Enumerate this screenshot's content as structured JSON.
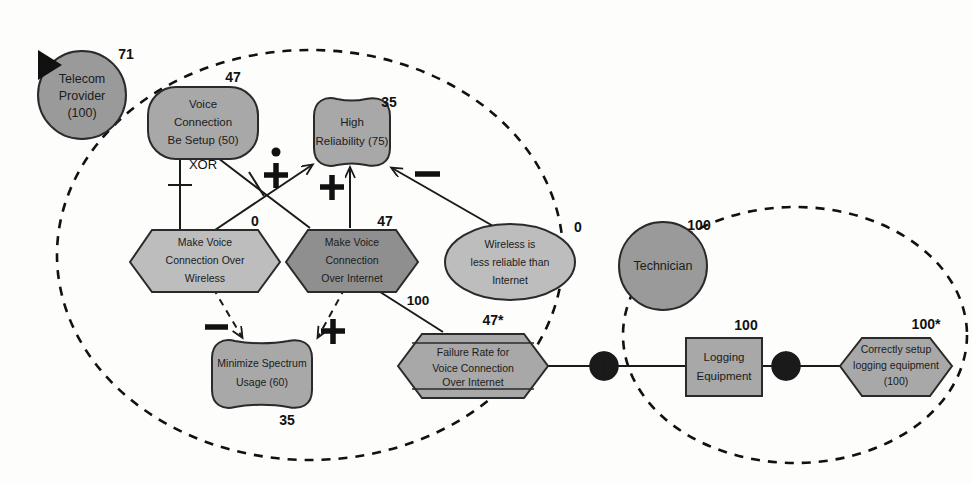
{
  "diagram": {
    "notation": "GRL (Goal-oriented Requirement Language)",
    "colors": {
      "fill_actor": "#9a9a9a",
      "fill_dark": "#8f8f8f",
      "fill_light": "#bdbdbd",
      "fill_mid": "#a8a8a8",
      "stroke": "#2a2a2a",
      "text": "#1b1b1b",
      "boundary": "#111111"
    }
  },
  "actors": [
    {
      "id": "telecom-provider",
      "name": "Telecom\nProvider\n(100)",
      "line1": "Telecom",
      "line2": "Provider",
      "line3": "(100)",
      "evaluation": "71",
      "selected": true
    },
    {
      "id": "technician",
      "name": "Technician",
      "line1": "Technician",
      "evaluation": "100",
      "selected": false
    }
  ],
  "elements": [
    {
      "id": "voice-connection-be-setup",
      "type": "goal",
      "lines": [
        "Voice",
        "Connection",
        "Be Setup (50)"
      ],
      "evaluation": "47"
    },
    {
      "id": "high-reliability",
      "type": "softgoal",
      "lines": [
        "High",
        "Reliability (75)"
      ],
      "evaluation": "35"
    },
    {
      "id": "make-voice-connection-over-wireless",
      "type": "task",
      "lines": [
        "Make Voice",
        "Connection Over",
        "Wireless"
      ],
      "evaluation": "0"
    },
    {
      "id": "make-voice-connection-over-internet",
      "type": "task",
      "lines": [
        "Make Voice",
        "Connection",
        "Over Internet"
      ],
      "evaluation": "47"
    },
    {
      "id": "wireless-is-less-reliable-than-internet",
      "type": "belief",
      "lines": [
        "Wireless is",
        "less reliable than",
        "Internet"
      ],
      "evaluation": "0"
    },
    {
      "id": "minimize-spectrum-usage",
      "type": "softgoal",
      "lines": [
        "Minimize Spectrum",
        "Usage (60)"
      ],
      "evaluation": "35"
    },
    {
      "id": "failure-rate-for-voice-connection-over-internet",
      "type": "indicator",
      "lines": [
        "Failure Rate for",
        "Voice Connection",
        "Over Internet"
      ],
      "evaluation": "47*"
    },
    {
      "id": "logging-equipment",
      "type": "resource",
      "lines": [
        "Logging",
        "Equipment"
      ],
      "evaluation": "100"
    },
    {
      "id": "correctly-setup-logging-equipment",
      "type": "indicator",
      "lines": [
        "Correctly setup",
        "logging equipment",
        "(100)"
      ],
      "evaluation": "100*"
    }
  ],
  "links": [
    {
      "id": "decomp-xor",
      "type": "decomposition",
      "label": "XOR",
      "from": "make-voice-connection-over-wireless",
      "to": "voice-connection-be-setup"
    },
    {
      "id": "decomp-internet",
      "type": "decomposition",
      "label": "",
      "from": "make-voice-connection-over-internet",
      "to": "voice-connection-be-setup"
    },
    {
      "id": "contrib-wireless-to-reliability",
      "type": "contribution",
      "label": "make",
      "symbol": "++",
      "from": "make-voice-connection-over-wireless",
      "to": "high-reliability"
    },
    {
      "id": "contrib-internet-to-reliability",
      "type": "contribution",
      "label": "help",
      "symbol": "+",
      "from": "make-voice-connection-over-internet",
      "to": "high-reliability"
    },
    {
      "id": "contrib-belief-to-reliability",
      "type": "contribution",
      "label": "hurt",
      "symbol": "−",
      "from": "wireless-is-less-reliable-than-internet",
      "to": "high-reliability"
    },
    {
      "id": "contrib-wireless-to-spectrum",
      "type": "contribution",
      "label": "hurt",
      "symbol": "−",
      "from": "make-voice-connection-over-wireless",
      "to": "minimize-spectrum-usage"
    },
    {
      "id": "contrib-internet-to-spectrum",
      "type": "contribution",
      "label": "help",
      "symbol": "+",
      "from": "make-voice-connection-over-internet",
      "to": "minimize-spectrum-usage"
    },
    {
      "id": "contrib-failure-to-internet",
      "type": "contribution",
      "label": "100",
      "symbol": "100",
      "from": "failure-rate-for-voice-connection-over-internet",
      "to": "make-voice-connection-over-internet"
    },
    {
      "id": "dep-failure-logging",
      "type": "dependency",
      "label": "",
      "from": "failure-rate-for-voice-connection-over-internet",
      "to": "logging-equipment"
    },
    {
      "id": "dep-logging-correctly-setup",
      "type": "dependency",
      "label": "",
      "from": "logging-equipment",
      "to": "correctly-setup-logging-equipment"
    }
  ],
  "link_labels": {
    "xor": "XOR",
    "contrib_100": "100"
  }
}
